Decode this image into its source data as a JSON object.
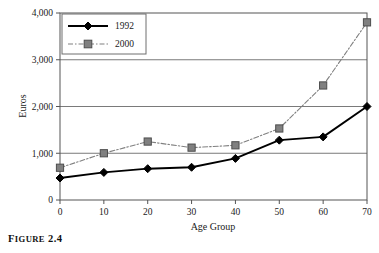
{
  "figure": {
    "caption_lead": "F",
    "caption_rest": "IGURE",
    "caption_number": "2.4",
    "caption_full": "FIGURE 2.4"
  },
  "chart_data": {
    "type": "line",
    "title": "",
    "xlabel": "Age Group",
    "ylabel": "Euros",
    "x": [
      0,
      10,
      20,
      30,
      40,
      50,
      60,
      70
    ],
    "xticklabels": [
      "0",
      "10",
      "20",
      "30",
      "40",
      "50",
      "60",
      "70"
    ],
    "yticks": [
      0,
      1000,
      2000,
      3000,
      4000
    ],
    "yticklabels": [
      "0",
      "1,000",
      "2,000",
      "3,000",
      "4,000"
    ],
    "xlim": [
      0,
      70
    ],
    "ylim": [
      0,
      4000
    ],
    "grid": "horizontal",
    "legend_position": "upper-left-inside",
    "series": [
      {
        "name": "1992",
        "values": [
          470,
          590,
          670,
          700,
          890,
          1280,
          1350,
          2000
        ],
        "color": "#000000",
        "marker": "diamond",
        "line_style": "solid"
      },
      {
        "name": "2000",
        "values": [
          690,
          1000,
          1250,
          1120,
          1170,
          1530,
          2450,
          3800
        ],
        "color": "#808080",
        "marker": "square",
        "line_style": "dash-dot"
      }
    ]
  },
  "colors": {
    "series_1992": "#000000",
    "series_2000": "#808080",
    "grid": "#7a7a7a",
    "axis": "#555555",
    "background": "#ffffff"
  }
}
